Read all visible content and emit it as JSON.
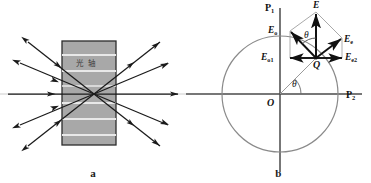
{
  "figure": {
    "width": 371,
    "height": 183,
    "background": "#ffffff",
    "panels": [
      {
        "id": "a",
        "caption": "a",
        "title_text": "光 轴",
        "crystal": {
          "fill": "#a8a8a8",
          "stroke": "#2b2b2b",
          "stripe_color": "#e8e8e8",
          "x": 62,
          "y": 41,
          "width": 54,
          "height": 104,
          "stripe_count": 6
        },
        "optical_axis": {
          "color": "#bdbdbd",
          "y": 94,
          "x1": 0,
          "x2": 186
        },
        "focus": {
          "x": 94,
          "y": 94
        },
        "ray_color": "#1a1a1a",
        "rays_in": 5,
        "rays_out": 5
      },
      {
        "id": "b",
        "caption": "b",
        "axis_color": "#4a4a4a",
        "circle": {
          "cx": 94,
          "cy": 94,
          "r": 58,
          "stroke": "#8a8a8a"
        },
        "origin_label": "O",
        "point_label": "Q",
        "axis_labels": {
          "vertical": "P",
          "vertical_sub": "1",
          "horizontal": "P",
          "horizontal_sub": "2"
        },
        "angle_label": "θ",
        "vectors": [
          {
            "name": "E",
            "sub": "",
            "label": "E",
            "kind": "resultant"
          },
          {
            "name": "E_o",
            "sub": "o",
            "label": "E",
            "kind": "ordinary"
          },
          {
            "name": "E_e",
            "sub": "e",
            "label": "E",
            "kind": "extraordinary"
          },
          {
            "name": "E_o1",
            "sub": "o1",
            "label": "E",
            "kind": "ordinary-component"
          },
          {
            "name": "E_e2",
            "sub": "e2",
            "label": "E",
            "kind": "extraordinary-component"
          }
        ]
      }
    ]
  },
  "colors": {
    "ray": "#1a1a1a",
    "crystal_fill": "#a8a8a8",
    "crystal_stroke": "#2b2b2b",
    "stripe": "#e8e8e8",
    "axis": "#4a4a4a",
    "circle": "#8a8a8a",
    "construction": "#9a9a9a",
    "optical_axis_line": "#bdbdbd"
  }
}
